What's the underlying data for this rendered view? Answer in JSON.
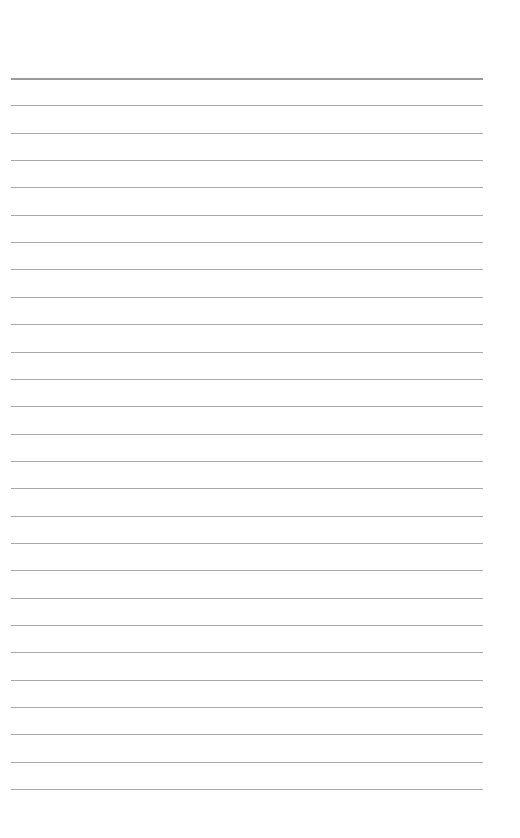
{
  "page": {
    "type": "lined-paper",
    "background": "#ffffff",
    "line_color": "#a9a9a9",
    "top_line_color": "#9a9a9a",
    "line_count": 27,
    "first_line_y": 78,
    "line_spacing": 27.35,
    "line_left": 11,
    "line_width": 472
  }
}
